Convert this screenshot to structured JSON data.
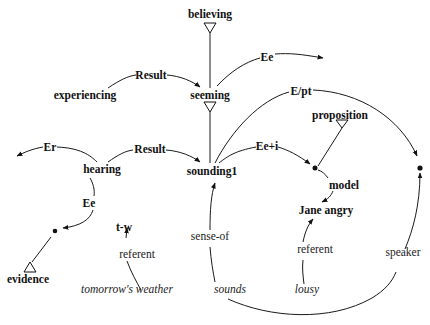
{
  "diagram": {
    "nodes": {
      "believing": "believing",
      "seeming": "seeming",
      "experiencing": "experiencing",
      "hearing": "hearing",
      "sounding1": "sounding1",
      "proposition": "proposition",
      "model": "model",
      "jane_angry": "Jane angry",
      "evidence": "evidence",
      "t_w": "t-w",
      "tomorrows_weather": "tomorrow's weather",
      "sounds": "sounds",
      "lousy": "lousy"
    },
    "edge_labels": {
      "result_top": "Result",
      "result_bottom": "Result",
      "ee_top": "Ee",
      "e_pt": "E/pt",
      "ee_i": "Ee+i",
      "er": "Er",
      "ee_left": "Ee",
      "referent_left": "referent",
      "sense_of": "sense-of",
      "referent_right": "referent",
      "speaker": "speaker"
    }
  }
}
